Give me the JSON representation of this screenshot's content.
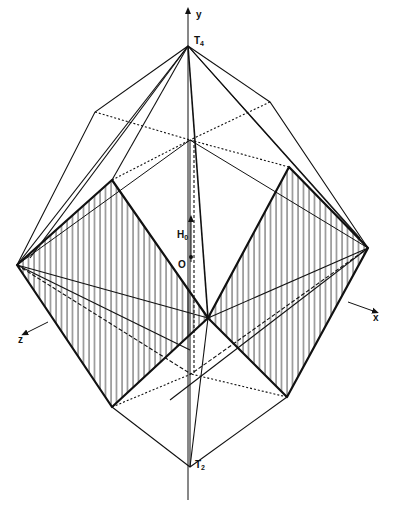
{
  "figure": {
    "type": "polyhedron-projection",
    "stroke_color": "#111111",
    "hatch_color": "#333333",
    "labels": {
      "y_axis": "y",
      "x_axis": "x",
      "z_axis": "z",
      "top_apex": "T",
      "top_apex_sub": "4",
      "bottom_apex": "T",
      "bottom_apex_sub": "2",
      "field": "H",
      "field_sub": "0",
      "origin": "O"
    },
    "caption": ""
  }
}
